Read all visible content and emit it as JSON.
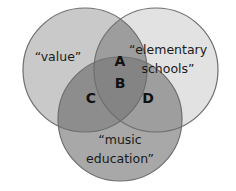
{
  "diagram": {
    "type": "venn-3-set",
    "background_color": "#ffffff",
    "stroke_color": "#6e6e6e",
    "title": "",
    "sets": [
      {
        "id": "value",
        "label_line1": "“value”",
        "label_line2": "",
        "fill": "#c9c9c9",
        "cx": 85,
        "cy": 70,
        "r": 62
      },
      {
        "id": "elementary-schools",
        "label_line1": "“elementary",
        "label_line2": "schools”",
        "fill": "#e2e2e2",
        "cx": 156,
        "cy": 70,
        "r": 62
      },
      {
        "id": "music-education",
        "label_line1": "“music",
        "label_line2": "education”",
        "fill": "#a8a8a8",
        "cx": 120,
        "cy": 119,
        "r": 62
      }
    ],
    "regions": [
      {
        "id": "A",
        "label": "A",
        "description": "value ∩ elementary schools",
        "fill": "#9d9d9d",
        "x": 120,
        "y": 62
      },
      {
        "id": "B",
        "label": "B",
        "description": "value ∩ elementary schools ∩ music education",
        "fill": "#848484",
        "x": 120,
        "y": 84
      },
      {
        "id": "C",
        "label": "C",
        "description": "value ∩ music education",
        "fill": "#8d8d8d",
        "x": 91,
        "y": 99
      },
      {
        "id": "D",
        "label": "D",
        "description": "elementary schools ∩ music education",
        "fill": "#9e9e9e",
        "x": 148,
        "y": 99
      }
    ]
  }
}
